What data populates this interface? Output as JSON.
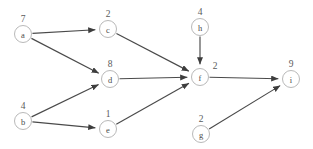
{
  "diagram": {
    "background_color": "#ffffff",
    "node_stroke_color": "#b9b9b9",
    "node_fill_color": "#ffffff",
    "edge_color": "#4a4a4a",
    "text_color": "#4a4a4a",
    "nodes": [
      {
        "id": "a",
        "label": "a",
        "weight": "7",
        "cx": 23,
        "cy": 34,
        "r": 8.5,
        "weight_x": 23,
        "weight_y": 19
      },
      {
        "id": "b",
        "label": "b",
        "weight": "4",
        "cx": 23,
        "cy": 121,
        "r": 8.5,
        "weight_x": 23,
        "weight_y": 106
      },
      {
        "id": "c",
        "label": "c",
        "weight": "2",
        "cx": 108,
        "cy": 29,
        "r": 8.5,
        "weight_x": 108,
        "weight_y": 14
      },
      {
        "id": "d",
        "label": "d",
        "weight": "8",
        "cx": 110,
        "cy": 79,
        "r": 8.5,
        "weight_x": 110,
        "weight_y": 64
      },
      {
        "id": "e",
        "label": "e",
        "weight": "1",
        "cx": 108,
        "cy": 129,
        "r": 8.5,
        "weight_x": 108,
        "weight_y": 114
      },
      {
        "id": "f",
        "label": "f",
        "weight": "2",
        "cx": 200,
        "cy": 77,
        "r": 8.5,
        "weight_x": 215,
        "weight_y": 66
      },
      {
        "id": "g",
        "label": "g",
        "weight": "2",
        "cx": 201,
        "cy": 134,
        "r": 8.5,
        "weight_x": 201,
        "weight_y": 119
      },
      {
        "id": "h",
        "label": "h",
        "weight": "4",
        "cx": 200,
        "cy": 27,
        "r": 8.5,
        "weight_x": 200,
        "weight_y": 12
      },
      {
        "id": "i",
        "label": "i",
        "weight": "9",
        "cx": 291,
        "cy": 79,
        "r": 8.5,
        "weight_x": 291,
        "weight_y": 64
      }
    ],
    "edges": [
      {
        "from": "a",
        "to": "c"
      },
      {
        "from": "a",
        "to": "d"
      },
      {
        "from": "b",
        "to": "d"
      },
      {
        "from": "b",
        "to": "e"
      },
      {
        "from": "c",
        "to": "f"
      },
      {
        "from": "d",
        "to": "f"
      },
      {
        "from": "e",
        "to": "f"
      },
      {
        "from": "h",
        "to": "f"
      },
      {
        "from": "f",
        "to": "i"
      },
      {
        "from": "g",
        "to": "i"
      }
    ]
  }
}
